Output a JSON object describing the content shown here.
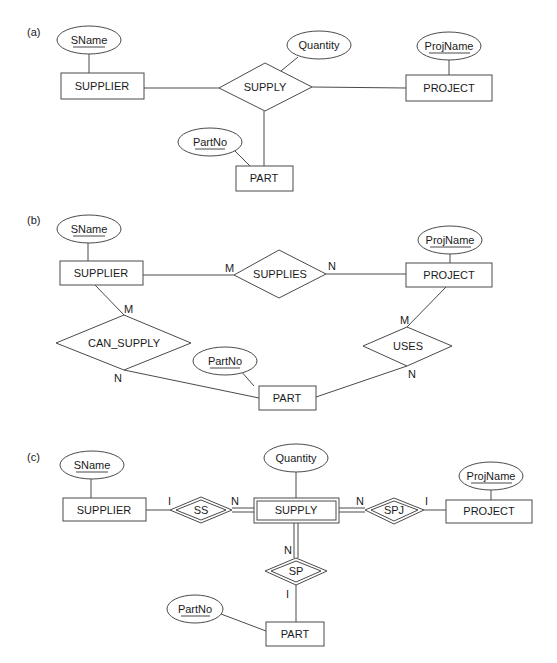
{
  "diagram": {
    "panels": [
      {
        "label": "(a)",
        "entities": {
          "supplier": "SUPPLIER",
          "project": "PROJECT",
          "part": "PART"
        },
        "relationships": {
          "supply": "SUPPLY"
        },
        "attributes": {
          "sname": "SName",
          "quantity": "Quantity",
          "projname": "ProjName",
          "partno": "PartNo"
        }
      },
      {
        "label": "(b)",
        "entities": {
          "supplier": "SUPPLIER",
          "project": "PROJECT",
          "part": "PART"
        },
        "relationships": {
          "supplies": "SUPPLIES",
          "can_supply": "CAN_SUPPLY",
          "uses": "USES"
        },
        "attributes": {
          "sname": "SName",
          "projname": "ProjName",
          "partno": "PartNo"
        },
        "cardinalities": {
          "supplies_supplier": "M",
          "supplies_project": "N",
          "can_supply_supplier": "M",
          "can_supply_part": "N",
          "uses_project": "M",
          "uses_part": "N"
        }
      },
      {
        "label": "(c)",
        "entities": {
          "supplier": "SUPPLIER",
          "project": "PROJECT",
          "part": "PART",
          "supply": "SUPPLY"
        },
        "relationships": {
          "ss": "SS",
          "spj": "SPJ",
          "sp": "SP"
        },
        "attributes": {
          "sname": "SName",
          "quantity": "Quantity",
          "projname": "ProjName",
          "partno": "PartNo"
        },
        "cardinalities": {
          "ss_supplier": "I",
          "ss_supply": "N",
          "spj_supply": "N",
          "spj_project": "I",
          "sp_supply": "N",
          "sp_part": "I"
        }
      }
    ]
  }
}
